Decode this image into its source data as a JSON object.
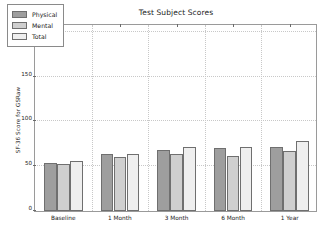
{
  "chart_data": {
    "type": "bar",
    "title": "Test Subject Scores",
    "xlabel": "",
    "ylabel": "SF-36 Score for GSRaw",
    "categories": [
      "Baseline",
      "1 Month",
      "3 Month",
      "6 Month",
      "1 Year"
    ],
    "series": [
      {
        "name": "Physical",
        "values": [
          54,
          64,
          68,
          70,
          71
        ],
        "color": "#9e9e9e"
      },
      {
        "name": "Mental",
        "values": [
          53,
          60,
          64,
          61,
          67
        ],
        "color": "#cfcfcf"
      },
      {
        "name": "Total",
        "values": [
          56,
          64,
          72,
          71,
          78
        ],
        "color": "#efefef"
      }
    ],
    "ylim": [
      0,
      210
    ],
    "yticks": [
      0,
      50,
      100,
      150,
      200
    ],
    "ytick_labels": [
      "0",
      "50",
      "100",
      "150",
      "200"
    ],
    "grid": true,
    "legend_position": "upper left",
    "background": "#ffffff",
    "axis_color": "#9a9a9a",
    "grid_color": "#c8c8c8"
  }
}
